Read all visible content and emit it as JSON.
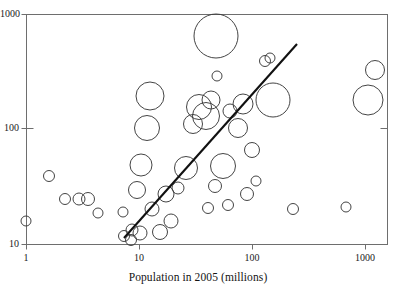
{
  "chart_data": {
    "type": "scatter",
    "title": "",
    "subtitle": "",
    "xlabel": "Population in 2005 (millions)",
    "ylabel": "",
    "xscale": "log",
    "yscale": "log",
    "xlim": [
      1,
      2000
    ],
    "ylim": [
      10,
      1000
    ],
    "grid": false,
    "legend": null,
    "xticks": [
      {
        "value": 1,
        "label": "1",
        "px": 26
      },
      {
        "value": 10,
        "label": "10",
        "px": 139
      },
      {
        "value": 100,
        "label": "100",
        "px": 252
      },
      {
        "value": 1000,
        "label": "1000",
        "px": 365
      }
    ],
    "yticks": [
      {
        "value": 10,
        "label": "10",
        "px": 244
      },
      {
        "value": 100,
        "label": "100",
        "px": 128
      },
      {
        "value": 1000,
        "label": "1000",
        "px": 14
      }
    ],
    "marker": "open-circle",
    "marker_color": "#3a3a3a",
    "size_encoding": "bubble-radius",
    "points": [
      {
        "cx": 26,
        "cy": 221,
        "r": 5.0
      },
      {
        "cx": 49,
        "cy": 176,
        "r": 5.5
      },
      {
        "cx": 65,
        "cy": 199,
        "r": 5.5
      },
      {
        "cx": 79,
        "cy": 199,
        "r": 6.0
      },
      {
        "cx": 88,
        "cy": 199,
        "r": 6.5
      },
      {
        "cx": 98,
        "cy": 213,
        "r": 5.0
      },
      {
        "cx": 123,
        "cy": 212,
        "r": 5.0
      },
      {
        "cx": 124,
        "cy": 236,
        "r": 5.5
      },
      {
        "cx": 131,
        "cy": 240,
        "r": 5.5
      },
      {
        "cx": 132,
        "cy": 230,
        "r": 6.0
      },
      {
        "cx": 140,
        "cy": 233,
        "r": 7.0
      },
      {
        "cx": 137,
        "cy": 190,
        "r": 8.5
      },
      {
        "cx": 141,
        "cy": 165,
        "r": 11.0
      },
      {
        "cx": 147,
        "cy": 128,
        "r": 12.5
      },
      {
        "cx": 150,
        "cy": 96,
        "r": 14.0
      },
      {
        "cx": 152,
        "cy": 209,
        "r": 7.0
      },
      {
        "cx": 160,
        "cy": 232,
        "r": 7.5
      },
      {
        "cx": 166,
        "cy": 194,
        "r": 8.0
      },
      {
        "cx": 171,
        "cy": 221,
        "r": 7.0
      },
      {
        "cx": 178,
        "cy": 188,
        "r": 6.0
      },
      {
        "cx": 186,
        "cy": 168,
        "r": 11.5
      },
      {
        "cx": 193,
        "cy": 124,
        "r": 9.5
      },
      {
        "cx": 199,
        "cy": 107,
        "r": 12.5
      },
      {
        "cx": 206,
        "cy": 116,
        "r": 13.5
      },
      {
        "cx": 211,
        "cy": 100,
        "r": 9.0
      },
      {
        "cx": 216,
        "cy": 36,
        "r": 22.0
      },
      {
        "cx": 217,
        "cy": 76,
        "r": 5.0
      },
      {
        "cx": 208,
        "cy": 208,
        "r": 5.5
      },
      {
        "cx": 215,
        "cy": 186,
        "r": 6.5
      },
      {
        "cx": 223,
        "cy": 166,
        "r": 12.5
      },
      {
        "cx": 228,
        "cy": 205,
        "r": 5.5
      },
      {
        "cx": 230,
        "cy": 111,
        "r": 7.0
      },
      {
        "cx": 238,
        "cy": 128,
        "r": 9.5
      },
      {
        "cx": 243,
        "cy": 104,
        "r": 10.0
      },
      {
        "cx": 247,
        "cy": 194,
        "r": 6.5
      },
      {
        "cx": 252,
        "cy": 150,
        "r": 7.5
      },
      {
        "cx": 256,
        "cy": 181,
        "r": 5.0
      },
      {
        "cx": 270,
        "cy": 58,
        "r": 5.0
      },
      {
        "cx": 265,
        "cy": 61,
        "r": 5.5
      },
      {
        "cx": 273,
        "cy": 100,
        "r": 17.0
      },
      {
        "cx": 293,
        "cy": 209,
        "r": 5.5
      },
      {
        "cx": 346,
        "cy": 207,
        "r": 5.0
      },
      {
        "cx": 375,
        "cy": 70,
        "r": 9.5
      },
      {
        "cx": 368,
        "cy": 100,
        "r": 15.0
      }
    ],
    "trendline": {
      "x1": 124,
      "y1": 238,
      "x2": 297,
      "y2": 44,
      "color": "#111111",
      "width": 2.1
    },
    "frame": {
      "left": 26,
      "right": 387,
      "top": 14,
      "bottom": 244,
      "color": "#6e6e6e"
    }
  }
}
